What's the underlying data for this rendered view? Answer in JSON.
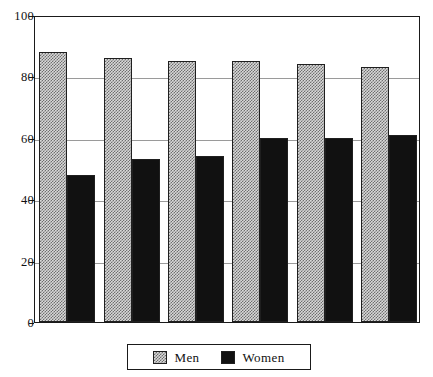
{
  "chart_data": {
    "type": "bar",
    "title": "",
    "subtitle": "",
    "xlabel": "",
    "ylabel": "",
    "categories": [
      "1",
      "2",
      "3",
      "4",
      "5",
      "6"
    ],
    "series": [
      {
        "name": "Men",
        "values": [
          88,
          86,
          85,
          85,
          84,
          83
        ],
        "fill": "hatch-light-gray",
        "color": "#d8d8d8"
      },
      {
        "name": "Women",
        "values": [
          48,
          53,
          54,
          60,
          60,
          61
        ],
        "fill": "solid-black",
        "color": "#111111"
      }
    ],
    "ylim": [
      0,
      100
    ],
    "yticks": [
      0,
      20,
      40,
      60,
      80,
      100
    ],
    "ytick_labels": [
      "0",
      "20",
      "40",
      "60",
      "80",
      "100"
    ],
    "xtick_labels": [
      "",
      "",
      "",
      "",
      "",
      ""
    ],
    "grid": {
      "horizontal": true,
      "vertical": false,
      "color": "#9a9a9a"
    },
    "legend": {
      "position": "bottom",
      "boxed": true,
      "entries": [
        "Men",
        "Women"
      ]
    },
    "frame": {
      "border": true,
      "color": "#1a1a1a"
    }
  },
  "legend": {
    "entries": [
      {
        "label": "Men"
      },
      {
        "label": "Women"
      }
    ]
  }
}
